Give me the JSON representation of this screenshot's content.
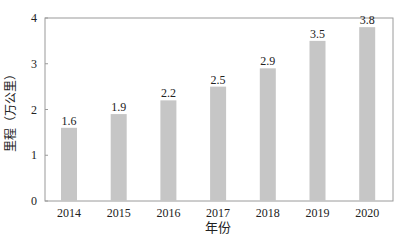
{
  "chart_data": {
    "type": "bar",
    "title": "",
    "xlabel": "年份",
    "ylabel": "里程（万公里）",
    "categories": [
      "2014",
      "2015",
      "2016",
      "2017",
      "2018",
      "2019",
      "2020"
    ],
    "values": [
      1.6,
      1.9,
      2.2,
      2.5,
      2.9,
      3.5,
      3.8
    ],
    "data_labels": [
      "1.6",
      "1.9",
      "2.2",
      "2.5",
      "2.9",
      "3.5",
      "3.8"
    ],
    "ylim": [
      0,
      4
    ],
    "yticks": [
      "0",
      "1",
      "2",
      "3",
      "4"
    ],
    "grid": false,
    "legend": null,
    "bar_color": "#c6c6c6"
  }
}
